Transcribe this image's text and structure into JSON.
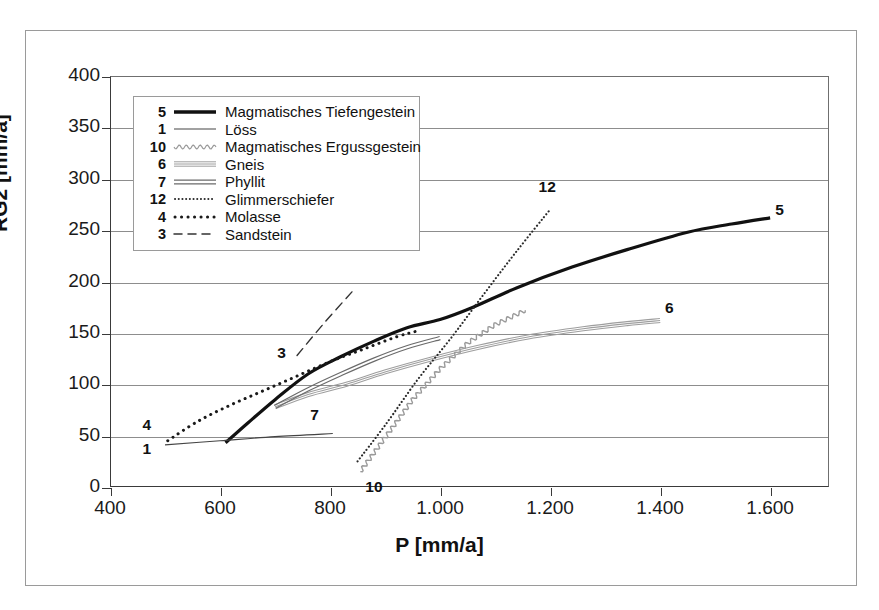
{
  "chart_data": {
    "type": "line",
    "title": "",
    "xlabel": "P [mm/a]",
    "ylabel": "RG2 [mm/a]",
    "xlim": [
      400,
      1707
    ],
    "ylim": [
      0,
      400
    ],
    "xticks": [
      400,
      600,
      800,
      1000,
      1200,
      1400,
      1600
    ],
    "xticklabels": [
      "400",
      "600",
      "800",
      "1.000",
      "1.200",
      "1.400",
      "1.600"
    ],
    "yticks": [
      0,
      50,
      100,
      150,
      200,
      250,
      300,
      350,
      400
    ],
    "yticklabels": [
      "0",
      "50",
      "100",
      "150",
      "200",
      "250",
      "300",
      "350",
      "400"
    ],
    "grid": "horizontal",
    "legend_position": "upper-left-inside",
    "series": [
      {
        "key": "5",
        "name": "Magmatisches Tiefengestein",
        "style": "thick-solid",
        "color": "#111111",
        "width": 3.2,
        "label_pos": {
          "x": 1620,
          "y": 268
        },
        "points": [
          [
            610,
            43
          ],
          [
            650,
            62
          ],
          [
            700,
            85
          ],
          [
            760,
            110
          ],
          [
            820,
            127
          ],
          [
            880,
            142
          ],
          [
            940,
            155
          ],
          [
            1000,
            163
          ],
          [
            1060,
            175
          ],
          [
            1140,
            194
          ],
          [
            1240,
            214
          ],
          [
            1340,
            231
          ],
          [
            1450,
            248
          ],
          [
            1530,
            256
          ],
          [
            1600,
            262
          ]
        ]
      },
      {
        "key": "1",
        "name": "Löss",
        "style": "thin-solid",
        "color": "#444444",
        "width": 1.1,
        "label_pos": {
          "x": 470,
          "y": 35
        },
        "points": [
          [
            500,
            41
          ],
          [
            600,
            45
          ],
          [
            700,
            49
          ],
          [
            805,
            52
          ]
        ]
      },
      {
        "key": "10",
        "name": "Magmatisches Ergussgestein",
        "style": "wavy",
        "color": "#9a9a9a",
        "width": 1.4,
        "label_pos": {
          "x": 875,
          "y": -2
        },
        "points": [
          [
            855,
            15
          ],
          [
            900,
            48
          ],
          [
            950,
            85
          ],
          [
            1000,
            115
          ],
          [
            1050,
            140
          ],
          [
            1100,
            158
          ],
          [
            1155,
            172
          ]
        ]
      },
      {
        "key": "6",
        "name": "Gneis",
        "style": "triple-thin",
        "color": "#9e9e9e",
        "width": 1.1,
        "label_pos": {
          "x": 1420,
          "y": 172
        },
        "points": [
          [
            700,
            78
          ],
          [
            760,
            90
          ],
          [
            830,
            100
          ],
          [
            900,
            112
          ],
          [
            980,
            124
          ],
          [
            1070,
            136
          ],
          [
            1160,
            146
          ],
          [
            1260,
            154
          ],
          [
            1340,
            159
          ],
          [
            1400,
            162
          ]
        ]
      },
      {
        "key": "7",
        "name": "Phyllit",
        "style": "double",
        "color": "#6a6a6a",
        "width": 1.2,
        "label_pos": {
          "x": 775,
          "y": 68
        },
        "points": [
          [
            700,
            78
          ],
          [
            760,
            95
          ],
          [
            820,
            110
          ],
          [
            880,
            124
          ],
          [
            940,
            136
          ],
          [
            1000,
            145
          ]
        ]
      },
      {
        "key": "12",
        "name": "Glimmerschiefer",
        "style": "fine-dotted",
        "color": "#2a2a2a",
        "width": 2.1,
        "label_pos": {
          "x": 1190,
          "y": 290
        },
        "points": [
          [
            850,
            25
          ],
          [
            900,
            60
          ],
          [
            960,
            105
          ],
          [
            1020,
            145
          ],
          [
            1080,
            188
          ],
          [
            1140,
            230
          ],
          [
            1200,
            270
          ]
        ]
      },
      {
        "key": "4",
        "name": "Molasse",
        "style": "coarse-dotted",
        "color": "#1a1a1a",
        "width": 3.0,
        "label_pos": {
          "x": 470,
          "y": 58
        },
        "points": [
          [
            505,
            45
          ],
          [
            560,
            64
          ],
          [
            620,
            80
          ],
          [
            680,
            94
          ],
          [
            740,
            108
          ],
          [
            800,
            122
          ],
          [
            860,
            134
          ],
          [
            920,
            146
          ],
          [
            960,
            152
          ]
        ]
      },
      {
        "key": "3",
        "name": "Sandstein",
        "style": "dashed",
        "color": "#333333",
        "width": 1.4,
        "label_pos": {
          "x": 715,
          "y": 128
        },
        "points": [
          [
            740,
            128
          ],
          [
            790,
            160
          ],
          [
            840,
            190
          ]
        ]
      }
    ]
  },
  "legend": {
    "items": [
      {
        "key": "5",
        "label": "Magmatisches Tiefengestein"
      },
      {
        "key": "1",
        "label": "Löss"
      },
      {
        "key": "10",
        "label": "Magmatisches Ergussgestein"
      },
      {
        "key": "6",
        "label": "Gneis"
      },
      {
        "key": "7",
        "label": "Phyllit"
      },
      {
        "key": "12",
        "label": "Glimmerschiefer"
      },
      {
        "key": "4",
        "label": "Molasse"
      },
      {
        "key": "3",
        "label": "Sandstein"
      }
    ]
  },
  "colors": {
    "axis": "#3a3a3a",
    "grid": "#8d8d8d",
    "frame": "#9a9a9a",
    "text": "#111111",
    "background": "#ffffff"
  }
}
